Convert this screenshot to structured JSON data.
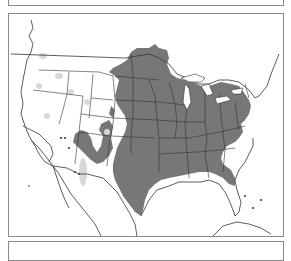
{
  "map": {
    "type": "species-range-map",
    "region": "North America (United States, southern Canada, northern Mexico)",
    "colors": {
      "background": "#ffffff",
      "range_fill": "#777777",
      "range_light_fill": "#d8d8d8",
      "border_line": "#333333",
      "panel_border": "#8a8a8a"
    },
    "legend": []
  }
}
